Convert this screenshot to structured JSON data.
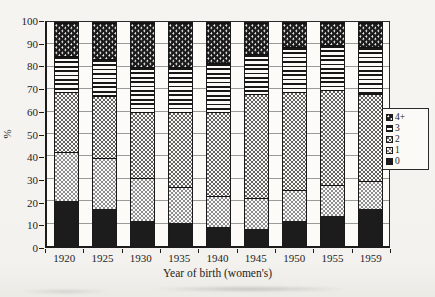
{
  "chart_data": {
    "type": "bar",
    "stacked": true,
    "title": "",
    "xlabel": "Year of birth (women's)",
    "ylabel": "%",
    "ylim": [
      0,
      100
    ],
    "yticks": [
      0,
      10,
      20,
      30,
      40,
      50,
      60,
      70,
      80,
      90,
      100
    ],
    "grid": "horizontal",
    "legend_position": "right-outside",
    "legend_order_top_to_bottom": [
      "4+",
      "3",
      "2",
      "1",
      "0"
    ],
    "categories": [
      "1920",
      "1925",
      "1930",
      "1935",
      "1940",
      "1945",
      "1950",
      "1955",
      "1959"
    ],
    "series": [
      {
        "name": "0",
        "pattern": "solid-black",
        "values": [
          20,
          16,
          11,
          10,
          8,
          7,
          11,
          13,
          16
        ]
      },
      {
        "name": "1",
        "pattern": "dark-gray-white-dots",
        "values": [
          22,
          23,
          19,
          16,
          14,
          14,
          14,
          14,
          13
        ]
      },
      {
        "name": "2",
        "pattern": "white-black-dots",
        "values": [
          27,
          28,
          30,
          34,
          38,
          47,
          44,
          43,
          39
        ]
      },
      {
        "name": "3",
        "pattern": "horizontal-stripes",
        "values": [
          16,
          17,
          20,
          20,
          22,
          18,
          20,
          20,
          21
        ]
      },
      {
        "name": "4+",
        "pattern": "black-white-dots",
        "values": [
          15,
          16,
          20,
          20,
          18,
          14,
          11,
          10,
          11
        ]
      }
    ],
    "colors": {
      "ink": "#1c1c1c",
      "gridline": "#9a9a9a",
      "plot_background": "#fcfbf8",
      "page_background": "#f4f3ef"
    }
  }
}
